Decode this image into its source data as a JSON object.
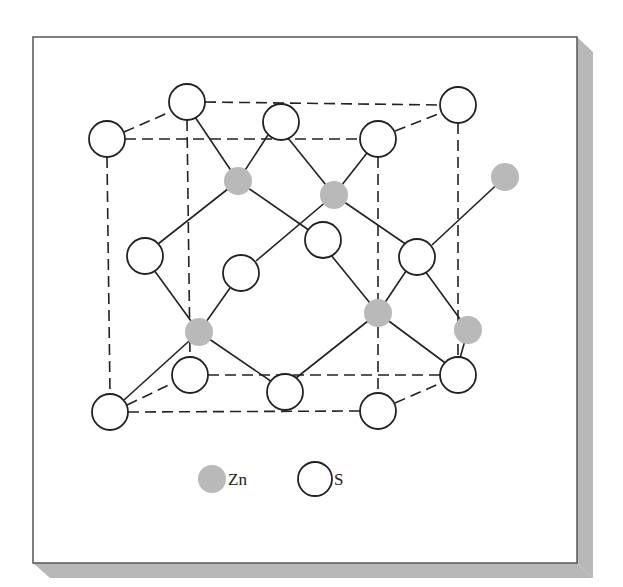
{
  "colors": {
    "frame": "#555555",
    "shadow": "#b8b8b8",
    "zn": "#b9b9b9",
    "s_fill": "#ffffff",
    "stroke": "#222222"
  },
  "legend": {
    "zn_label": "Zn",
    "s_label": "S"
  },
  "atoms": {
    "S": [
      {
        "x": 107,
        "y": 139
      },
      {
        "x": 187,
        "y": 102
      },
      {
        "x": 281,
        "y": 122
      },
      {
        "x": 378,
        "y": 139
      },
      {
        "x": 458,
        "y": 105
      },
      {
        "x": 145,
        "y": 256
      },
      {
        "x": 241,
        "y": 273
      },
      {
        "x": 323,
        "y": 240
      },
      {
        "x": 417,
        "y": 257
      },
      {
        "x": 190,
        "y": 375
      },
      {
        "x": 285,
        "y": 392
      },
      {
        "x": 458,
        "y": 375
      },
      {
        "x": 110,
        "y": 412
      },
      {
        "x": 378,
        "y": 411
      }
    ],
    "Zn": [
      {
        "x": 238,
        "y": 181
      },
      {
        "x": 334,
        "y": 195
      },
      {
        "x": 199,
        "y": 332
      },
      {
        "x": 378,
        "y": 313
      },
      {
        "x": 505,
        "y": 177
      },
      {
        "x": 468,
        "y": 330
      }
    ]
  }
}
